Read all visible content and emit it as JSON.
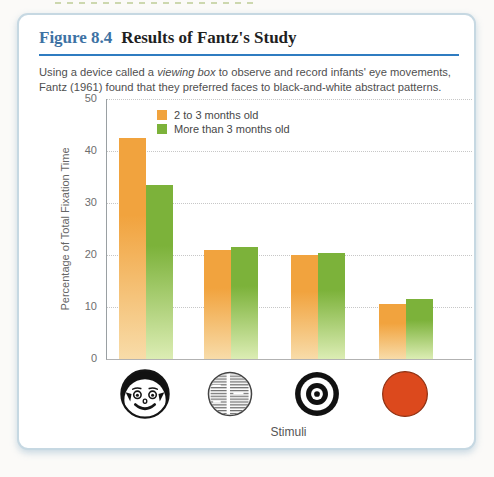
{
  "figure": {
    "label": "Figure 8.4",
    "title": "Results of Fantz's Study",
    "label_color": "#3d72a4",
    "accent_rule_color": "#2f7cc1",
    "caption": {
      "pre": "Using a device called a ",
      "italic": "viewing box",
      "post": " to observe and record infants' eye movements, Fantz (1961) found that they preferred faces to black-and-white abstract patterns."
    }
  },
  "chart_data": {
    "type": "bar",
    "title": "",
    "xlabel": "Stimuli",
    "ylabel": "Percentage of Total Fixation Time",
    "ylim": [
      0,
      50
    ],
    "yticks": [
      0,
      10,
      20,
      30,
      40,
      50
    ],
    "grid": "horizontal-dotted",
    "legend_position": "inside-top-left",
    "categories": [
      "face",
      "newspaper print",
      "bulls-eye",
      "plain red disk"
    ],
    "series": [
      {
        "name": "2 to 3 months old",
        "color": "#f1a33e",
        "color_light": "#f8dca9",
        "values": [
          42.5,
          21,
          20,
          10.5
        ]
      },
      {
        "name": "More than 3 months old",
        "color": "#7cb23a",
        "color_light": "#dcedb4",
        "values": [
          33.5,
          21.5,
          20.3,
          11.5
        ]
      }
    ],
    "stimuli": [
      {
        "icon": "face-icon"
      },
      {
        "icon": "newspaper-icon"
      },
      {
        "icon": "bullseye-icon"
      },
      {
        "icon": "red-disk-icon",
        "color": "#dc491d"
      }
    ]
  }
}
